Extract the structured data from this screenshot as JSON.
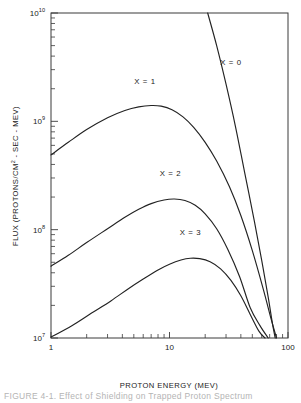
{
  "figure": {
    "caption": "FIGURE 4-1.  Effect of Shielding on Trapped Proton Spectrum"
  },
  "chart_data": {
    "type": "line",
    "title": "",
    "xlabel": "PROTON ENERGY (MEV)",
    "ylabel_parts": {
      "pre": "FLUX (PROTONS/CM",
      "sup": "2",
      "post": " - SEC - MEV)"
    },
    "ylabel": "FLUX (PROTONS/CM2 - SEC - MEV)",
    "xscale": "log",
    "yscale": "log",
    "xlim": [
      1,
      100
    ],
    "ylim": [
      10000000,
      10000000000
    ],
    "grid": false,
    "legend_position": "inline-curve-labels",
    "xticks": [
      {
        "value": 1,
        "label": "1"
      },
      {
        "value": 10,
        "label": "10"
      },
      {
        "value": 100,
        "label": "100"
      }
    ],
    "yticks": [
      {
        "value": 10000000,
        "mantissa": "10",
        "exponent": "7"
      },
      {
        "value": 100000000,
        "mantissa": "10",
        "exponent": "8"
      },
      {
        "value": 1000000000,
        "mantissa": "10",
        "exponent": "9"
      },
      {
        "value": 10000000000,
        "mantissa": "10",
        "exponent": "10"
      }
    ],
    "series": [
      {
        "name": "X = 0",
        "label": "X = 0",
        "label_x": 33,
        "label_y": 3300000000.0,
        "points": [
          [
            21.0,
            10000000000.0
          ],
          [
            25.0,
            5000000000.0
          ],
          [
            30.0,
            2200000000.0
          ],
          [
            36.0,
            900000000.0
          ],
          [
            43.0,
            340000000.0
          ],
          [
            52.0,
            120000000.0
          ],
          [
            60.0,
            52000000.0
          ],
          [
            68.0,
            24000000.0
          ],
          [
            74.0,
            13500000.0
          ],
          [
            78.0,
            10000000.0
          ]
        ]
      },
      {
        "name": "X = 1",
        "label": "X = 1",
        "label_x": 6.2,
        "label_y": 2200000000.0,
        "points": [
          [
            1.0,
            490000000.0
          ],
          [
            1.4,
            640000000.0
          ],
          [
            2.0,
            840000000.0
          ],
          [
            3.0,
            1080000000.0
          ],
          [
            4.2,
            1260000000.0
          ],
          [
            5.5,
            1360000000.0
          ],
          [
            7.0,
            1400000000.0
          ],
          [
            8.5,
            1380000000.0
          ],
          [
            10.5,
            1280000000.0
          ],
          [
            13.0,
            1100000000.0
          ],
          [
            16.0,
            880000000.0
          ],
          [
            20.0,
            640000000.0
          ],
          [
            25.0,
            430000000.0
          ],
          [
            32.0,
            250000000.0
          ],
          [
            40.0,
            135000000.0
          ],
          [
            50.0,
            64000000.0
          ],
          [
            62.0,
            28000000.0
          ],
          [
            72.0,
            15000000.0
          ],
          [
            80.0,
            10000000.0
          ]
        ]
      },
      {
        "name": "X = 2",
        "label": "X = 2",
        "label_x": 10.2,
        "label_y": 310000000.0,
        "points": [
          [
            1.0,
            46000000.0
          ],
          [
            1.4,
            58000000.0
          ],
          [
            2.0,
            76000000.0
          ],
          [
            3.0,
            102000000.0
          ],
          [
            4.2,
            130000000.0
          ],
          [
            5.5,
            154000000.0
          ],
          [
            7.0,
            174000000.0
          ],
          [
            9.0,
            188000000.0
          ],
          [
            11.0,
            192000000.0
          ],
          [
            13.5,
            186000000.0
          ],
          [
            16.5,
            168000000.0
          ],
          [
            20.0,
            140000000.0
          ],
          [
            25.0,
            102000000.0
          ],
          [
            31.0,
            66000000.0
          ],
          [
            39.0,
            37000000.0
          ],
          [
            48.0,
            19000000.0
          ],
          [
            58.0,
            13000000.0
          ],
          [
            68.0,
            10000000.0
          ]
        ]
      },
      {
        "name": "X = 3",
        "label": "X = 3",
        "label_x": 15.0,
        "label_y": 90000000.0,
        "points": [
          [
            1.0,
            10200000.0
          ],
          [
            1.5,
            13000000.0
          ],
          [
            2.2,
            17000000.0
          ],
          [
            3.2,
            22000000.0
          ],
          [
            4.5,
            28500000.0
          ],
          [
            6.0,
            35000000.0
          ],
          [
            8.0,
            42500000.0
          ],
          [
            10.0,
            48000000.0
          ],
          [
            12.5,
            52500000.0
          ],
          [
            15.0,
            54500000.0
          ],
          [
            18.0,
            54000000.0
          ],
          [
            22.0,
            50500000.0
          ],
          [
            27.0,
            43500000.0
          ],
          [
            33.0,
            34000000.0
          ],
          [
            40.0,
            24500000.0
          ],
          [
            48.0,
            16500000.0
          ],
          [
            57.0,
            11500000.0
          ],
          [
            64.0,
            10000000.0
          ]
        ]
      }
    ]
  }
}
